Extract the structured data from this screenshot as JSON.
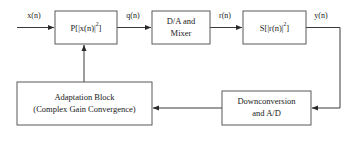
{
  "diagram": {
    "background_color": "#ffffff",
    "box_border_color": "#59595b",
    "wire_color": "#3a3a3a",
    "text_color": "#1a1a1a",
    "blocks": [
      {
        "id": "predistorter",
        "label_main": "P[|x(n)|",
        "label_sup": "2",
        "label_tail": "]",
        "full_label": "P[|x(n)|2]"
      },
      {
        "id": "da-mixer",
        "line1": "D/A and",
        "line2": "Mixer"
      },
      {
        "id": "amplifier",
        "label_main": "S[|r(n)|",
        "label_sup": "2",
        "label_tail": "]",
        "full_label": "S[|r(n)|2]"
      },
      {
        "id": "adaptation",
        "line1": "Adaptation Block",
        "line2": "(Complex Gain Convergence)"
      },
      {
        "id": "downconversion",
        "line1": "Downconversion",
        "line2": "and A/D"
      }
    ],
    "signals": [
      {
        "id": "input",
        "label": "x(n)"
      },
      {
        "id": "predistorted",
        "label": "q(n)"
      },
      {
        "id": "rf",
        "label": "r(n)"
      },
      {
        "id": "output",
        "label": "y(n)"
      }
    ]
  }
}
